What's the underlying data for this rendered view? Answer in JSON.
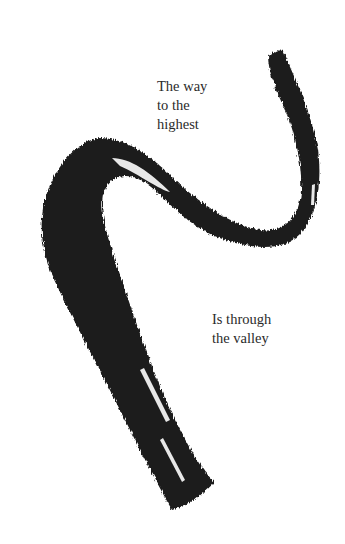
{
  "artwork": {
    "description": "ink brush stroke calligraphy",
    "background_color": "#ffffff",
    "ink_color": "#1c1c1c"
  },
  "captions": {
    "top": "The way\nto the\nhighest",
    "bottom": "Is through\nthe valley"
  }
}
